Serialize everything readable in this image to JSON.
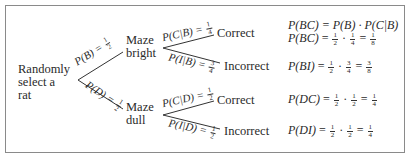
{
  "diagram": {
    "type": "probability-tree",
    "root": {
      "label_lines": [
        "Randomly",
        "select a",
        "rat"
      ]
    },
    "level1": [
      {
        "id": "B",
        "label_lines": [
          "Maze",
          "bright"
        ],
        "edge_label": "P(B) = ",
        "edge_num": "1",
        "edge_den": "2"
      },
      {
        "id": "D",
        "label_lines": [
          "Maze",
          "dull"
        ],
        "edge_label": "P(D) = ",
        "edge_num": "1",
        "edge_den": "2"
      }
    ],
    "level2": [
      {
        "parent": "B",
        "label": "Correct",
        "edge_label": "P(C|B) = ",
        "edge_num": "1",
        "edge_den": "4"
      },
      {
        "parent": "B",
        "label": "Incorrect",
        "edge_label": "P(I|B) = ",
        "edge_num": "3",
        "edge_den": "4"
      },
      {
        "parent": "D",
        "label": "Correct",
        "edge_label": "P(C|D) = ",
        "edge_num": "1",
        "edge_den": "2"
      },
      {
        "parent": "D",
        "label": "Incorrect",
        "edge_label": "P(I|D) = ",
        "edge_num": "1",
        "edge_den": "2"
      }
    ],
    "equations": [
      {
        "lhs": "P(BC)",
        "rhs_text": "= P(B) · P(C|B)"
      },
      {
        "lhs": "P(BC)",
        "a_num": "1",
        "a_den": "2",
        "b_num": "1",
        "b_den": "4",
        "r_num": "1",
        "r_den": "8"
      },
      {
        "lhs": "P(BI)",
        "a_num": "1",
        "a_den": "2",
        "b_num": "3",
        "b_den": "4",
        "r_num": "3",
        "r_den": "8"
      },
      {
        "lhs": "P(DC)",
        "a_num": "1",
        "a_den": "2",
        "b_num": "1",
        "b_den": "2",
        "r_num": "1",
        "r_den": "4"
      },
      {
        "lhs": "P(DI)",
        "a_num": "1",
        "a_den": "2",
        "b_num": "1",
        "b_den": "2",
        "r_num": "1",
        "r_den": "4"
      }
    ],
    "symbols": {
      "equals": "=",
      "dot": "·"
    }
  }
}
